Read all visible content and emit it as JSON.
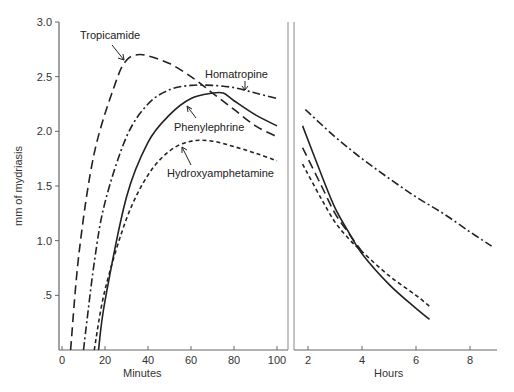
{
  "chart_data": [
    {
      "type": "line",
      "panel": "left",
      "title": "",
      "xlabel": "Minutes",
      "ylabel": "mm of mydriasis",
      "xlim": [
        0,
        105
      ],
      "ylim": [
        0,
        3.0
      ],
      "xticks": [
        0,
        20,
        40,
        60,
        80,
        100
      ],
      "xtick_labels": [
        "0",
        "20",
        "40",
        "60",
        "80",
        "100"
      ],
      "yticks": [
        0.5,
        1.0,
        1.5,
        2.0,
        2.5,
        3.0
      ],
      "ytick_labels": [
        ".5",
        "1.0",
        "1.5",
        "2.0",
        "2.5",
        "3.0"
      ],
      "grid": false,
      "series": [
        {
          "name": "Tropicamide",
          "style": "long-dash",
          "x": [
            4,
            8,
            15,
            25,
            30,
            35,
            40,
            50,
            60,
            70,
            80,
            90,
            100
          ],
          "y": [
            0,
            0.9,
            1.8,
            2.45,
            2.65,
            2.7,
            2.69,
            2.62,
            2.5,
            2.35,
            2.2,
            2.05,
            1.95
          ]
        },
        {
          "name": "Homatropine",
          "style": "dash-dot",
          "x": [
            10,
            15,
            20,
            30,
            40,
            50,
            60,
            70,
            80,
            90,
            100
          ],
          "y": [
            0,
            0.8,
            1.35,
            1.95,
            2.25,
            2.38,
            2.42,
            2.42,
            2.4,
            2.35,
            2.3
          ]
        },
        {
          "name": "Phenylephrine",
          "style": "solid",
          "x": [
            17,
            20,
            30,
            40,
            50,
            60,
            70,
            75,
            80,
            90,
            100
          ],
          "y": [
            0,
            0.45,
            1.4,
            1.9,
            2.15,
            2.3,
            2.35,
            2.35,
            2.28,
            2.15,
            2.05
          ]
        },
        {
          "name": "Hydroxyamphetamine",
          "style": "short-dash",
          "x": [
            15,
            20,
            30,
            40,
            50,
            60,
            70,
            80,
            90,
            100
          ],
          "y": [
            0,
            0.55,
            1.2,
            1.6,
            1.82,
            1.91,
            1.91,
            1.86,
            1.8,
            1.73
          ]
        }
      ],
      "annotations": [
        "Tropicamide",
        "Homatropine",
        "Phenylephrine",
        "Hydroxyamphetamine"
      ]
    },
    {
      "type": "line",
      "panel": "right",
      "title": "",
      "xlabel": "Hours",
      "ylabel": "",
      "xlim": [
        1.7,
        9
      ],
      "ylim": [
        0,
        3.0
      ],
      "xticks": [
        2,
        4,
        6,
        8
      ],
      "xtick_labels": [
        "2",
        "4",
        "6",
        "8"
      ],
      "grid": false,
      "series": [
        {
          "name": "Homatropine",
          "style": "dash-dot",
          "x": [
            1.9,
            3,
            4,
            5,
            6,
            7,
            8,
            8.8
          ],
          "y": [
            2.2,
            1.95,
            1.75,
            1.57,
            1.4,
            1.25,
            1.08,
            0.95
          ]
        },
        {
          "name": "Phenylephrine",
          "style": "solid",
          "x": [
            1.8,
            2.5,
            3,
            3.5,
            4,
            5,
            6,
            6.5
          ],
          "y": [
            2.05,
            1.6,
            1.3,
            1.08,
            0.88,
            0.6,
            0.38,
            0.28
          ]
        },
        {
          "name": "Tropicamide",
          "style": "long-dash",
          "x": [
            1.8,
            2.5,
            3,
            3.5,
            4
          ],
          "y": [
            1.85,
            1.5,
            1.25,
            1.07,
            0.9
          ]
        },
        {
          "name": "Hydroxyamphetamine",
          "style": "short-dash",
          "x": [
            1.8,
            2.5,
            3,
            3.5,
            4,
            5,
            6,
            6.5
          ],
          "y": [
            1.7,
            1.38,
            1.17,
            1.02,
            0.9,
            0.68,
            0.5,
            0.4
          ]
        }
      ]
    }
  ],
  "labels": {
    "ylabel": "mm of mydriasis",
    "xlabel_left": "Minutes",
    "xlabel_right": "Hours",
    "tropicamide": "Tropicamide",
    "homatropine": "Homatropine",
    "phenylephrine": "Phenylephrine",
    "hydroxyamphetamine": "Hydroxyamphetamine"
  },
  "colors": {
    "ink": "#222222",
    "axis": "#555555",
    "background": "#ffffff"
  }
}
